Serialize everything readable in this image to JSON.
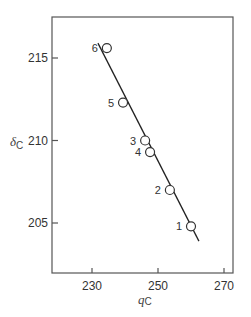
{
  "chart_data": {
    "type": "scatter",
    "title": "",
    "xlabel": "q_C",
    "ylabel": "δ_C",
    "xlim": [
      221,
      273
    ],
    "ylim": [
      202,
      217.5
    ],
    "xticks": [
      230,
      250,
      270
    ],
    "yticks": [
      205,
      210,
      215
    ],
    "grid": false,
    "legend": null,
    "series": [
      {
        "name": "points",
        "marker": "open-circle",
        "points": [
          {
            "label": "1",
            "x": 260.0,
            "y": 204.8
          },
          {
            "label": "2",
            "x": 253.6,
            "y": 207.0
          },
          {
            "label": "3",
            "x": 246.1,
            "y": 210.0
          },
          {
            "label": "4",
            "x": 247.6,
            "y": 209.3
          },
          {
            "label": "5",
            "x": 239.4,
            "y": 212.3
          },
          {
            "label": "6",
            "x": 234.5,
            "y": 215.6
          }
        ]
      }
    ],
    "fit_line": {
      "x0": 231.8,
      "y0": 215.9,
      "x1": 262.4,
      "y1": 203.9
    }
  },
  "axis_labels": {
    "x_main": "q",
    "x_sub": "C",
    "y_main": "δ",
    "y_sub": "C"
  },
  "tick_labels": {
    "x": [
      "230",
      "250",
      "270"
    ],
    "y": [
      "215",
      "210",
      "205"
    ]
  }
}
